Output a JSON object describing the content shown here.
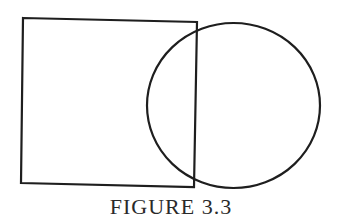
{
  "figure": {
    "caption": "FIGURE 3.3",
    "stroke_color": "#1e1e1e",
    "background": "#ffffff",
    "shapes": [
      {
        "type": "quadrilateral",
        "name": "square",
        "points": [
          [
            23,
            18
          ],
          [
            197,
            22
          ],
          [
            194,
            187
          ],
          [
            21,
            183
          ]
        ]
      },
      {
        "type": "ellipse",
        "name": "circle",
        "cx": 233.5,
        "cy": 105.5,
        "rx": 86.5,
        "ry": 82.5
      }
    ]
  }
}
